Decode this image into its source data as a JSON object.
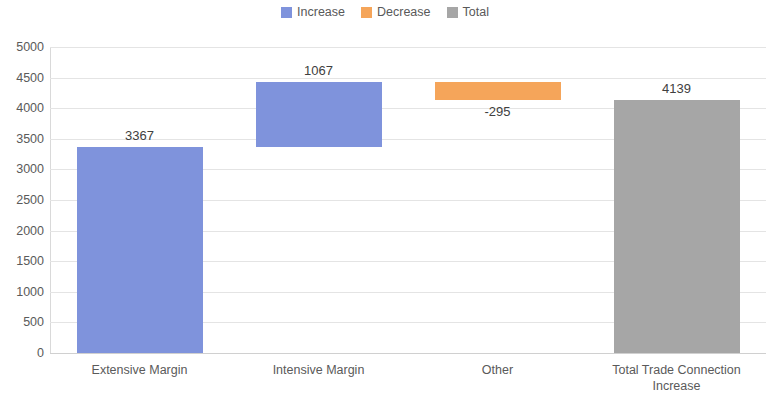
{
  "chart_data": {
    "type": "bar",
    "subtype": "waterfall",
    "title": "",
    "xlabel": "",
    "ylabel": "",
    "ylim": [
      0,
      5000
    ],
    "ytick_step": 500,
    "yticks": [
      "5000",
      "4500",
      "4000",
      "3500",
      "3000",
      "2500",
      "2000",
      "1500",
      "1000",
      "500",
      "0"
    ],
    "grid": true,
    "legend_position": "top-center",
    "categories": [
      "Extensive Margin",
      "Intensive Margin",
      "Other",
      "Total Trade Connection Increase"
    ],
    "values": [
      3367,
      1067,
      -295,
      4139
    ],
    "data_labels": [
      "3367",
      "1067",
      "-295",
      "4139"
    ],
    "bars": [
      {
        "category": "Extensive Margin",
        "label": "Extensive Margin",
        "value": 3367,
        "data_label": "3367",
        "base": 0,
        "top": 3367,
        "kind": "Increase",
        "color": "#7F93DC",
        "label_position": "above"
      },
      {
        "category": "Intensive Margin",
        "label": "Intensive Margin",
        "value": 1067,
        "data_label": "1067",
        "base": 3367,
        "top": 4434,
        "kind": "Increase",
        "color": "#7F93DC",
        "label_position": "above"
      },
      {
        "category": "Other",
        "label": "Other",
        "value": -295,
        "data_label": "-295",
        "base": 4139,
        "top": 4434,
        "kind": "Decrease",
        "color": "#F5A55A",
        "label_position": "below"
      },
      {
        "category": "Total Trade Connection Increase",
        "label": "Total Trade Connection\nIncrease",
        "value": 4139,
        "data_label": "4139",
        "base": 0,
        "top": 4139,
        "kind": "Total",
        "color": "#A6A6A6",
        "label_position": "above"
      }
    ],
    "series": [
      {
        "name": "Increase",
        "color": "#7F93DC"
      },
      {
        "name": "Decrease",
        "color": "#F5A55A"
      },
      {
        "name": "Total",
        "color": "#A6A6A6"
      }
    ]
  },
  "legend": {
    "items": [
      {
        "label": "Increase",
        "color": "#7F93DC"
      },
      {
        "label": "Decrease",
        "color": "#F5A55A"
      },
      {
        "label": "Total",
        "color": "#A6A6A6"
      }
    ]
  }
}
